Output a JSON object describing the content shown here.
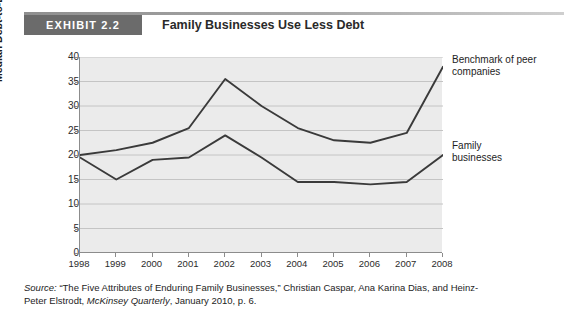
{
  "header": {
    "tag": "EXHIBIT 2.2",
    "title": "Family Businesses Use Less Debt"
  },
  "source": {
    "label": "Source:",
    "text_part1": " “The Five Attributes of Enduring Family Businesses,” Christian Caspar, Ana Karina Dias, and Heinz-Peter Elstrodt, ",
    "publication": "McKinsey Quarterly",
    "text_part2": ", January 2010, p. 6."
  },
  "annotations": {
    "benchmark": "Benchmark of peer\ncompanies",
    "family": "Family\nbusinesses"
  },
  "colors": {
    "tag_background": "#6b6b6b",
    "plot_background": "#ebebeb",
    "gridline": "#c4c4c4",
    "axis": "#8c8c8c",
    "series_line": "#3a3a3a"
  },
  "chart_data": {
    "type": "line",
    "title": "Family Businesses Use Less Debt",
    "xlabel": "",
    "ylabel": "Median Debt-to-Equity Ratio, %",
    "x": [
      "1998",
      "1999",
      "2000",
      "2001",
      "2002",
      "2003",
      "2004",
      "2005",
      "2006",
      "2007",
      "2008"
    ],
    "xlim": [
      1998,
      2008
    ],
    "ylim": [
      0,
      40
    ],
    "yticks": [
      0,
      5,
      10,
      15,
      20,
      25,
      30,
      35,
      40
    ],
    "grid": true,
    "legend_position": "right-inline-annotations",
    "series": [
      {
        "name": "Benchmark of peer companies",
        "values": [
          20,
          21,
          22.5,
          25.5,
          35.5,
          30,
          25.5,
          23,
          22.5,
          24.5,
          38
        ]
      },
      {
        "name": "Family businesses",
        "values": [
          19.5,
          15,
          19,
          19.5,
          24,
          19.5,
          14.5,
          14.5,
          14,
          14.5,
          20
        ]
      }
    ]
  }
}
